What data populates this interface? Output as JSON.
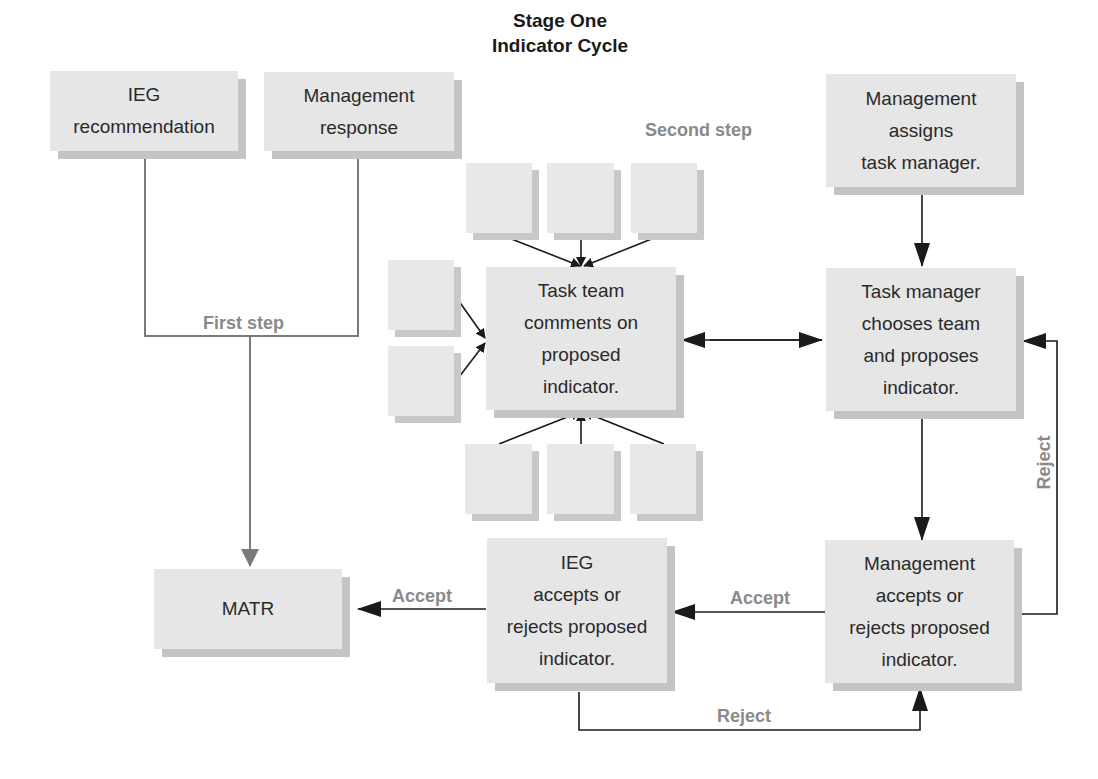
{
  "title": {
    "line1": "Stage One",
    "line2": "Indicator Cycle"
  },
  "nodes": {
    "ieg_recommendation": "IEG\nrecommendation",
    "management_response": "Management\nresponse",
    "management_assigns": "Management\nassigns\ntask manager.",
    "task_team_comments": "Task team\ncomments on\nproposed\nindicator.",
    "task_manager_chooses": "Task manager\nchooses team\nand proposes\nindicator.",
    "matr": "MATR",
    "ieg_accepts": "IEG\naccepts or\nrejects proposed\nindicator.",
    "management_accepts": "Management\naccepts or\nrejects proposed\nindicator."
  },
  "labels": {
    "first_step": "First step",
    "second_step": "Second step",
    "accept_to_matr": "Accept",
    "accept_to_ieg": "Accept",
    "reject_bottom": "Reject",
    "reject_right": "Reject"
  },
  "colors": {
    "box_fill": "#e6e6e6",
    "box_shadow": "#c4c4c4",
    "label_gray": "#8a8a8a",
    "arrow_dark": "#1a1a1a",
    "arrow_gray": "#7a7a7a"
  }
}
